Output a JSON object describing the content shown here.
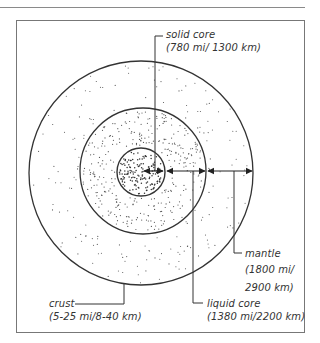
{
  "diagram": {
    "type": "earth-cross-section",
    "colors": {
      "line": "#333333",
      "dots": "#444444",
      "frame": "#777777"
    },
    "layers": [
      {
        "id": "solid-core",
        "name": "solid core",
        "thickness": "(780 mi/ 1300 km)"
      },
      {
        "id": "liquid-core",
        "name": "liquid core",
        "thickness": "(1380 mi/2200 km)"
      },
      {
        "id": "mantle",
        "name": "mantle",
        "thickness_line1": "(1800 mi/",
        "thickness_line2": "2900 km)"
      },
      {
        "id": "crust",
        "name": "crust",
        "thickness": "(5-25 mi/8-40 km)"
      }
    ]
  }
}
